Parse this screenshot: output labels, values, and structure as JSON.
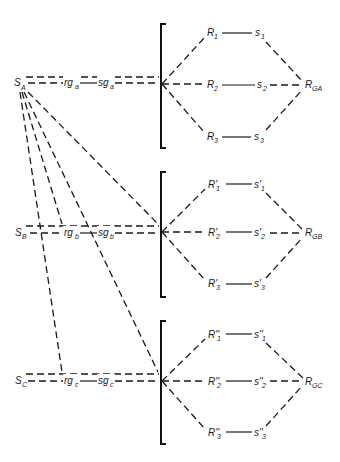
{
  "diagram": {
    "groups": [
      {
        "source": {
          "label": "S",
          "sub": "A"
        },
        "rg": {
          "label": "rg",
          "sub": "a"
        },
        "sg": {
          "label": "sg",
          "sub": "a"
        },
        "rows": [
          {
            "R": "R",
            "Rsub": "1",
            "s": "s",
            "ssub": "1"
          },
          {
            "R": "R",
            "Rsub": "2",
            "s": "s",
            "ssub": "2"
          },
          {
            "R": "R",
            "Rsub": "3",
            "s": "s",
            "ssub": "3"
          }
        ],
        "target": {
          "label": "R",
          "sub": "GA"
        }
      },
      {
        "source": {
          "label": "S",
          "sub": "B"
        },
        "rg": {
          "label": "rg",
          "sub": "b"
        },
        "sg": {
          "label": "sg",
          "sub": "b"
        },
        "rows": [
          {
            "R": "R'",
            "Rsub": "1",
            "s": "s'",
            "ssub": "1"
          },
          {
            "R": "R'",
            "Rsub": "2",
            "s": "s'",
            "ssub": "2"
          },
          {
            "R": "R'",
            "Rsub": "3",
            "s": "s'",
            "ssub": "3"
          }
        ],
        "target": {
          "label": "R",
          "sub": "GB"
        }
      },
      {
        "source": {
          "label": "S",
          "sub": "C"
        },
        "rg": {
          "label": "rg",
          "sub": "c"
        },
        "sg": {
          "label": "sg",
          "sub": "c"
        },
        "rows": [
          {
            "R": "R''",
            "Rsub": "1",
            "s": "s''",
            "ssub": "1"
          },
          {
            "R": "R''",
            "Rsub": "2",
            "s": "s''",
            "ssub": "2"
          },
          {
            "R": "R''",
            "Rsub": "3",
            "s": "s''",
            "ssub": "3"
          }
        ],
        "target": {
          "label": "R",
          "sub": "GC"
        }
      }
    ]
  }
}
